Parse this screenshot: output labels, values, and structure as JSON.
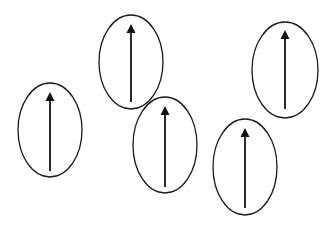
{
  "diagram": {
    "colors": {
      "background": "#ffffff",
      "stroke": "#1a1a1a",
      "arrow": "#111111"
    },
    "elements": [
      {
        "id": "domain-1",
        "cx": 50,
        "cy": 130,
        "rx": 32,
        "ry": 47,
        "arrow": {
          "direction": "up",
          "x": 50,
          "y_tip": 92,
          "y_tail": 171
        }
      },
      {
        "id": "domain-2",
        "cx": 131,
        "cy": 62,
        "rx": 32,
        "ry": 47,
        "arrow": {
          "direction": "up",
          "x": 131,
          "y_tip": 24,
          "y_tail": 102
        }
      },
      {
        "id": "domain-3",
        "cx": 165,
        "cy": 145,
        "rx": 32,
        "ry": 48,
        "arrow": {
          "direction": "up",
          "x": 165,
          "y_tip": 106,
          "y_tail": 187
        }
      },
      {
        "id": "domain-4",
        "cx": 245,
        "cy": 167,
        "rx": 32,
        "ry": 48,
        "arrow": {
          "direction": "up",
          "x": 245,
          "y_tip": 128,
          "y_tail": 208
        }
      },
      {
        "id": "domain-5",
        "cx": 285,
        "cy": 70,
        "rx": 33,
        "ry": 48,
        "arrow": {
          "direction": "up",
          "x": 285,
          "y_tip": 30,
          "y_tail": 109
        }
      }
    ]
  }
}
